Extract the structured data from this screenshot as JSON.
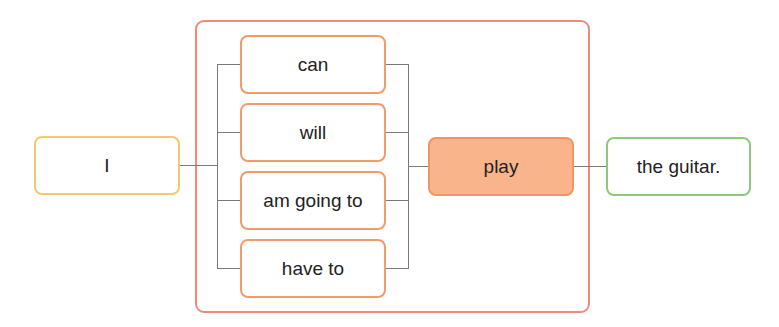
{
  "diagram": {
    "subject": {
      "label": "I",
      "border_color": "#f5c86a"
    },
    "modal_group": {
      "border_color": "#f08a7a",
      "items": [
        {
          "label": "can"
        },
        {
          "label": "will"
        },
        {
          "label": "am going to"
        },
        {
          "label": "have to"
        }
      ],
      "item_border_color": "#f39a6b"
    },
    "verb": {
      "label": "play",
      "fill_color": "#f9b48b",
      "border_color": "#f0946a"
    },
    "object": {
      "label": "the guitar.",
      "border_color": "#8cc97a"
    },
    "connector_color": "#7a7a7a"
  }
}
